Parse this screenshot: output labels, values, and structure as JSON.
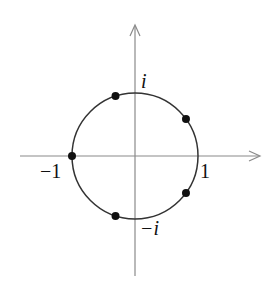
{
  "diagram": {
    "type": "complex-plane-roots-of-unity",
    "colors": {
      "axis": "#8a8a8a",
      "circle": "#333333",
      "point": "#111111",
      "text": "#111111",
      "background": "#ffffff"
    },
    "geometry": {
      "center": [
        135,
        156
      ],
      "radius": 63,
      "x_axis": {
        "x1": 20,
        "x2": 260,
        "y": 156
      },
      "y_axis": {
        "x": 135,
        "y1": 276,
        "y2": 25
      }
    },
    "labels": {
      "i": "i",
      "minus_i": "−i",
      "one": "1",
      "minus_one": "−1"
    },
    "points": [
      {
        "name": "root-36deg",
        "angle_deg": 36
      },
      {
        "name": "root-108deg",
        "angle_deg": 108
      },
      {
        "name": "root-180deg",
        "angle_deg": 180
      },
      {
        "name": "root-252deg",
        "angle_deg": 252
      },
      {
        "name": "root-324deg",
        "angle_deg": 324
      }
    ]
  }
}
